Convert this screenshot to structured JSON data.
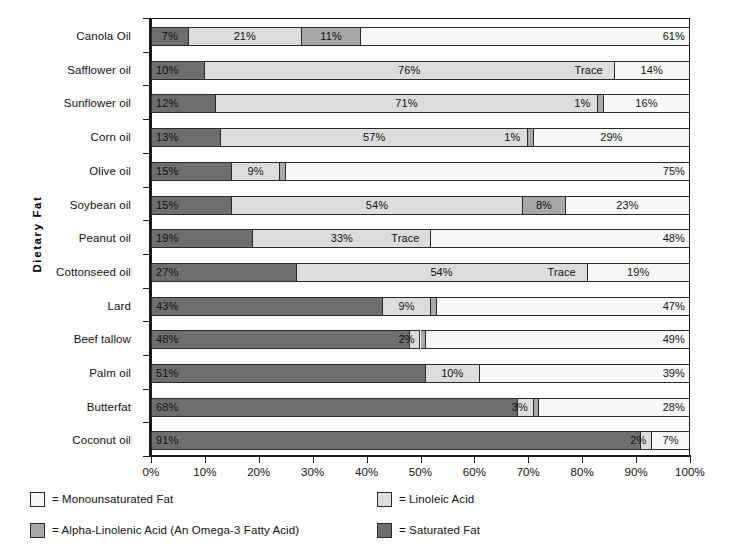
{
  "chart_data": {
    "type": "bar",
    "subtype": "stacked-horizontal-100pct",
    "title": "",
    "xlabel": "",
    "ylabel": "Dietary Fat",
    "xlim": [
      0,
      100
    ],
    "xticks": [
      "0%",
      "10%",
      "20%",
      "30%",
      "40%",
      "50%",
      "60%",
      "70%",
      "80%",
      "90%",
      "100%"
    ],
    "xtick_values": [
      0,
      10,
      20,
      30,
      40,
      50,
      60,
      70,
      80,
      90,
      100
    ],
    "grid": false,
    "legend_position": "bottom",
    "categories": [
      "Canola Oil",
      "Safflower oil",
      "Sunflower oil",
      "Corn oil",
      "Olive oil",
      "Soybean oil",
      "Peanut oil",
      "Cottonseed oil",
      "Lard",
      "Beef tallow",
      "Palm oil",
      "Butterfat",
      "Coconut oil"
    ],
    "series": [
      {
        "name": "Saturated Fat",
        "key": "saturated",
        "values": [
          7,
          10,
          12,
          13,
          15,
          15,
          19,
          27,
          43,
          48,
          51,
          68,
          91
        ]
      },
      {
        "name": "Linoleic Acid",
        "key": "linoleic",
        "values": [
          21,
          76,
          71,
          57,
          9,
          54,
          33,
          54,
          9,
          2,
          10,
          3,
          2
        ]
      },
      {
        "name": "Alpha-Linolenic Acid (An Omega-3 Fatty Acid)",
        "key": "alpha_linolenic",
        "values": [
          11,
          0,
          1,
          1,
          1,
          8,
          0,
          0,
          1,
          1,
          0,
          1,
          0
        ]
      },
      {
        "name": "Monounsaturated Fat",
        "key": "monounsaturated",
        "values": [
          61,
          14,
          16,
          29,
          75,
          23,
          48,
          19,
          47,
          49,
          39,
          28,
          7
        ]
      }
    ],
    "colors": {
      "saturated": "#6e6e6e",
      "linoleic": "#dcdcdc",
      "alpha_linolenic": "#a8a8a8",
      "monounsaturated": "#f7f7f7",
      "outline": "#2a2a2a",
      "axis": "#1a1a1a"
    },
    "rows": [
      {
        "category": "Canola Oil",
        "segments": [
          {
            "key": "saturated",
            "value": 7,
            "label": "7%",
            "align": "center"
          },
          {
            "key": "linoleic",
            "value": 21,
            "label": "21%",
            "align": "center"
          },
          {
            "key": "alpha_linolenic",
            "value": 11,
            "label": "11%",
            "align": "center"
          },
          {
            "key": "monounsaturated",
            "value": 61,
            "label": "61%",
            "align": "right"
          }
        ]
      },
      {
        "category": "Safflower oil",
        "segments": [
          {
            "key": "saturated",
            "value": 10,
            "label": "10%",
            "align": "left"
          },
          {
            "key": "linoleic",
            "value": 76,
            "label": "76%",
            "align": "center"
          },
          {
            "key": "alpha_linolenic",
            "value": 0,
            "label": "Trace",
            "align": "trace-left"
          },
          {
            "key": "monounsaturated",
            "value": 14,
            "label": "14%",
            "align": "center"
          }
        ]
      },
      {
        "category": "Sunflower oil",
        "segments": [
          {
            "key": "saturated",
            "value": 12,
            "label": "12%",
            "align": "left"
          },
          {
            "key": "linoleic",
            "value": 71,
            "label": "71%",
            "align": "center"
          },
          {
            "key": "alpha_linolenic",
            "value": 1,
            "label": "1%",
            "align": "outside-left"
          },
          {
            "key": "monounsaturated",
            "value": 16,
            "label": "16%",
            "align": "center"
          }
        ]
      },
      {
        "category": "Corn oil",
        "segments": [
          {
            "key": "saturated",
            "value": 13,
            "label": "13%",
            "align": "left"
          },
          {
            "key": "linoleic",
            "value": 57,
            "label": "57%",
            "align": "center"
          },
          {
            "key": "alpha_linolenic",
            "value": 1,
            "label": "1%",
            "align": "outside-left"
          },
          {
            "key": "monounsaturated",
            "value": 29,
            "label": "29%",
            "align": "center"
          }
        ]
      },
      {
        "category": "Olive oil",
        "segments": [
          {
            "key": "saturated",
            "value": 15,
            "label": "15%",
            "align": "left"
          },
          {
            "key": "linoleic",
            "value": 9,
            "label": "9%",
            "align": "center"
          },
          {
            "key": "alpha_linolenic",
            "value": 1,
            "label": "1%",
            "align": "outside-right"
          },
          {
            "key": "monounsaturated",
            "value": 75,
            "label": "75%",
            "align": "right"
          }
        ]
      },
      {
        "category": "Soybean oil",
        "segments": [
          {
            "key": "saturated",
            "value": 15,
            "label": "15%",
            "align": "left"
          },
          {
            "key": "linoleic",
            "value": 54,
            "label": "54%",
            "align": "center"
          },
          {
            "key": "alpha_linolenic",
            "value": 8,
            "label": "8%",
            "align": "center"
          },
          {
            "key": "monounsaturated",
            "value": 23,
            "label": "23%",
            "align": "center"
          }
        ]
      },
      {
        "category": "Peanut oil",
        "segments": [
          {
            "key": "saturated",
            "value": 19,
            "label": "19%",
            "align": "left"
          },
          {
            "key": "linoleic",
            "value": 33,
            "label": "33%",
            "align": "center"
          },
          {
            "key": "alpha_linolenic",
            "value": 0,
            "label": "Trace",
            "align": "trace-left"
          },
          {
            "key": "monounsaturated",
            "value": 48,
            "label": "48%",
            "align": "right"
          }
        ]
      },
      {
        "category": "Cottonseed oil",
        "segments": [
          {
            "key": "saturated",
            "value": 27,
            "label": "27%",
            "align": "left"
          },
          {
            "key": "linoleic",
            "value": 54,
            "label": "54%",
            "align": "center"
          },
          {
            "key": "alpha_linolenic",
            "value": 0,
            "label": "Trace",
            "align": "trace-left"
          },
          {
            "key": "monounsaturated",
            "value": 19,
            "label": "19%",
            "align": "center"
          }
        ]
      },
      {
        "category": "Lard",
        "segments": [
          {
            "key": "saturated",
            "value": 43,
            "label": "43%",
            "align": "left"
          },
          {
            "key": "linoleic",
            "value": 9,
            "label": "9%",
            "align": "center"
          },
          {
            "key": "alpha_linolenic",
            "value": 1,
            "label": "1%",
            "align": "outside-right"
          },
          {
            "key": "monounsaturated",
            "value": 47,
            "label": "47%",
            "align": "right"
          }
        ]
      },
      {
        "category": "Beef tallow",
        "segments": [
          {
            "key": "saturated",
            "value": 48,
            "label": "48%",
            "align": "left"
          },
          {
            "key": "linoleic",
            "value": 2,
            "label": "2%",
            "align": "shift-left"
          },
          {
            "key": "alpha_linolenic",
            "value": 1,
            "label": "1%",
            "align": "outside-right"
          },
          {
            "key": "monounsaturated",
            "value": 49,
            "label": "49%",
            "align": "right"
          }
        ]
      },
      {
        "category": "Palm oil",
        "segments": [
          {
            "key": "saturated",
            "value": 51,
            "label": "51%",
            "align": "left"
          },
          {
            "key": "linoleic",
            "value": 10,
            "label": "10%",
            "align": "center"
          },
          {
            "key": "alpha_linolenic",
            "value": 0,
            "label": "Trace",
            "align": "trace-right"
          },
          {
            "key": "monounsaturated",
            "value": 39,
            "label": "39%",
            "align": "right"
          }
        ]
      },
      {
        "category": "Butterfat",
        "segments": [
          {
            "key": "saturated",
            "value": 68,
            "label": "68%",
            "align": "left"
          },
          {
            "key": "linoleic",
            "value": 3,
            "label": "3%",
            "align": "shift-left"
          },
          {
            "key": "alpha_linolenic",
            "value": 1,
            "label": "1%",
            "align": "outside-right"
          },
          {
            "key": "monounsaturated",
            "value": 28,
            "label": "28%",
            "align": "right"
          }
        ]
      },
      {
        "category": "Coconut oil",
        "segments": [
          {
            "key": "saturated",
            "value": 91,
            "label": "91%",
            "align": "left"
          },
          {
            "key": "linoleic",
            "value": 2,
            "label": "2%",
            "align": "shift-left"
          },
          {
            "key": "alpha_linolenic",
            "value": 0,
            "label": "",
            "align": "none"
          },
          {
            "key": "monounsaturated",
            "value": 7,
            "label": "7%",
            "align": "center"
          }
        ]
      }
    ],
    "legend": [
      {
        "key": "monounsaturated",
        "label": "= Monounsaturated Fat",
        "column": "left",
        "row": 0
      },
      {
        "key": "alpha_linolenic",
        "label": "= Alpha-Linolenic Acid (An Omega-3 Fatty Acid)",
        "column": "left",
        "row": 1
      },
      {
        "key": "linoleic",
        "label": "= Linoleic Acid",
        "column": "right",
        "row": 0
      },
      {
        "key": "saturated",
        "label": "= Saturated Fat",
        "column": "right",
        "row": 1
      }
    ]
  }
}
